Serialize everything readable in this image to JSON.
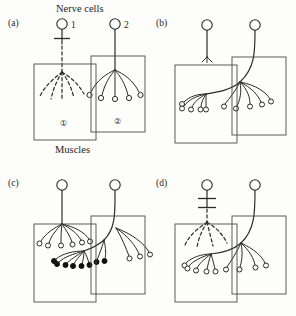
{
  "figure": {
    "title_label": "Nerve cells",
    "bottom_label": "Muscles",
    "neuron_labels": {
      "one": "1",
      "two": "2"
    },
    "muscle_labels": {
      "one": "①",
      "two": "②"
    }
  },
  "panels": [
    {
      "id": "a",
      "label": "(a)",
      "description": "Nerve cell 1 axon cut; its terminals degenerate (dashed) in muscle 1. Nerve cell 2 innervates muscle 2 with five intact endplates.",
      "neuron1": {
        "state": "cut",
        "cut_bars": 1,
        "terminals": "degenerating",
        "terminal_count": 5,
        "terminal_style": "dashed"
      },
      "neuron2": {
        "state": "intact",
        "terminals": "intact",
        "terminal_count": 5,
        "terminal_style": "open-circle"
      }
    },
    {
      "id": "b",
      "label": "(b)",
      "description": "Nerve cell 1 terminal has withdrawn to a small stub. Nerve cell 2 sprouts across and reinnervates both muscle 1 and muscle 2.",
      "neuron1": {
        "state": "withdrawn",
        "terminals": "stub",
        "terminal_count": 0,
        "terminal_style": "none"
      },
      "neuron2": {
        "state": "sprouting",
        "terminals": "expanded",
        "terminal_count": 10,
        "terminal_style": "open-circle"
      }
    },
    {
      "id": "c",
      "label": "(c)",
      "description": "Nerve cell 1 has regenerated and reclaimed muscle 1 (upper row of open endplates). Displaced sprouts of nerve cell 2 remain as filled terminals below.",
      "neuron1": {
        "state": "regenerated",
        "terminals": "restored",
        "terminal_count": 6,
        "terminal_style": "open-circle"
      },
      "neuron2": {
        "state": "retracting",
        "terminals": "displaced",
        "terminal_count": 8,
        "terminal_style": "filled-circle"
      }
    },
    {
      "id": "d",
      "label": "(d)",
      "description": "Nerve cell 1 cut again (double bar); terminals degenerate. Nerve cell 2 again sprouts to occupy both muscles.",
      "neuron1": {
        "state": "cut",
        "cut_bars": 2,
        "terminals": "degenerating",
        "terminal_count": 4,
        "terminal_style": "dashed"
      },
      "neuron2": {
        "state": "sprouting",
        "terminals": "expanded",
        "terminal_count": 9,
        "terminal_style": "open-circle"
      }
    }
  ],
  "colors": {
    "ink": "#2b2b2b",
    "box_stroke": "#4a4a4a",
    "filled_terminal": "#111111",
    "background": "#fdfdfc"
  }
}
